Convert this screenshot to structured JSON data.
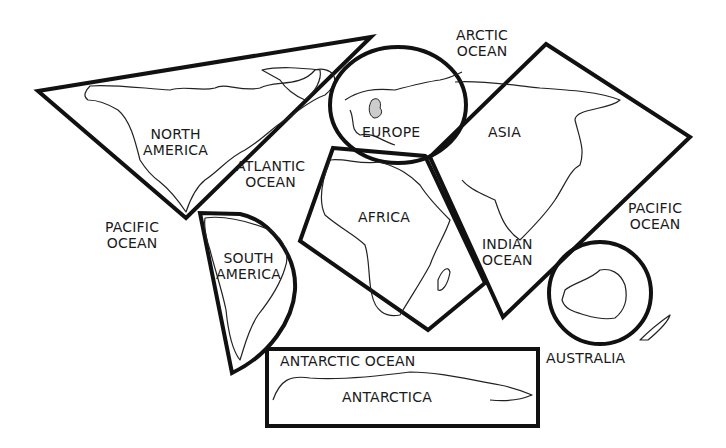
{
  "map": {
    "title": "World continents and oceans",
    "colors": {
      "outline": "#111111",
      "coast": "#222222",
      "background": "#ffffff",
      "highlight": "#cccccc"
    },
    "continents": [
      {
        "name": "NORTH AMERICA",
        "line1": "NORTH",
        "line2": "AMERICA",
        "frame_shape": "triangle"
      },
      {
        "name": "SOUTH AMERICA",
        "line1": "SOUTH",
        "line2": "AMERICA",
        "frame_shape": "half-circle wedge"
      },
      {
        "name": "EUROPE",
        "line1": "EUROPE",
        "frame_shape": "circle"
      },
      {
        "name": "AFRICA",
        "line1": "AFRICA",
        "frame_shape": "pentagon"
      },
      {
        "name": "ASIA",
        "line1": "ASIA",
        "frame_shape": "diamond"
      },
      {
        "name": "AUSTRALIA",
        "line1": "AUSTRALIA",
        "frame_shape": "circle"
      },
      {
        "name": "ANTARCTICA",
        "line1": "ANTARCTICA",
        "frame_shape": "rectangle"
      }
    ],
    "oceans": [
      {
        "name": "ARCTIC OCEAN",
        "line1": "ARCTIC",
        "line2": "OCEAN"
      },
      {
        "name": "ATLANTIC OCEAN",
        "line1": "ATLANTIC",
        "line2": "OCEAN"
      },
      {
        "name": "PACIFIC OCEAN (west)",
        "line1": "PACIFIC",
        "line2": "OCEAN"
      },
      {
        "name": "PACIFIC OCEAN (east)",
        "line1": "PACIFIC",
        "line2": "OCEAN"
      },
      {
        "name": "INDIAN OCEAN",
        "line1": "INDIAN",
        "line2": "OCEAN"
      },
      {
        "name": "ANTARCTIC OCEAN",
        "line1": "ANTARCTIC OCEAN"
      }
    ]
  }
}
